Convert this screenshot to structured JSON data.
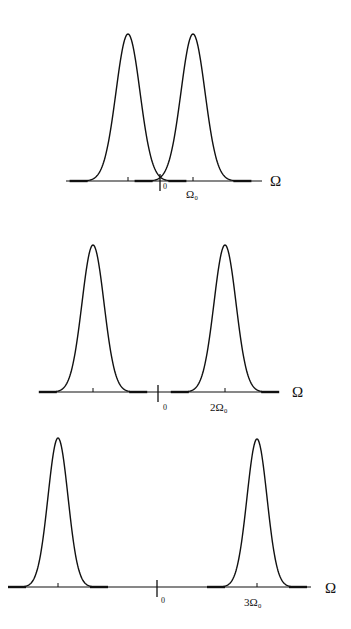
{
  "chart_data": [
    {
      "type": "line",
      "title": "",
      "xlabel": "Ω",
      "ylabel": "",
      "grid": false,
      "tick_labels": [
        "0",
        "Ω₀"
      ],
      "peaks_at": [
        "-Ω₀",
        "Ω₀"
      ],
      "description": "Two Gaussian spectral peaks symmetric about 0 at ±Ω0",
      "axis": {
        "y": 181,
        "x0": 66,
        "x1": 262,
        "zero_x": 160
      },
      "peaks": [
        {
          "cx": 128,
          "top": 34,
          "w": 12
        },
        {
          "cx": 193,
          "top": 34,
          "w": 12
        }
      ],
      "labels": {
        "zero": "0",
        "tick": "Ω₀",
        "axis": "Ω"
      }
    },
    {
      "type": "line",
      "title": "",
      "xlabel": "Ω",
      "ylabel": "",
      "grid": false,
      "tick_labels": [
        "0",
        "2Ω₀"
      ],
      "peaks_at": [
        "-2Ω₀",
        "2Ω₀"
      ],
      "description": "Two Gaussian spectral peaks symmetric about 0 at ±2Ω0",
      "axis": {
        "y": 392,
        "x0": 40,
        "x1": 278,
        "zero_x": 158
      },
      "peaks": [
        {
          "cx": 93,
          "top": 245,
          "w": 11
        },
        {
          "cx": 225,
          "top": 245,
          "w": 11
        }
      ],
      "labels": {
        "zero": "0",
        "tick": "2Ω₀",
        "axis": "Ω"
      }
    },
    {
      "type": "line",
      "title": "",
      "xlabel": "Ω",
      "ylabel": "",
      "grid": false,
      "tick_labels": [
        "0",
        "3Ω₀"
      ],
      "peaks_at": [
        "-3Ω₀",
        "3Ω₀"
      ],
      "description": "Two Gaussian spectral peaks symmetric about 0 at ±3Ω0",
      "axis": {
        "y": 587,
        "x0": 8,
        "x1": 311,
        "zero_x": 157
      },
      "peaks": [
        {
          "cx": 58,
          "top": 438,
          "w": 10
        },
        {
          "cx": 257,
          "top": 439,
          "w": 10
        }
      ],
      "labels": {
        "zero": "0",
        "tick": "3Ω₀",
        "axis": "Ω"
      }
    }
  ],
  "panels": [
    {
      "zero": "0",
      "tick": "Ω₀",
      "axis": "Ω"
    },
    {
      "zero": "0",
      "tick": "2Ω₀",
      "axis": "Ω"
    },
    {
      "zero": "0",
      "tick": "3Ω₀",
      "axis": "Ω"
    }
  ]
}
